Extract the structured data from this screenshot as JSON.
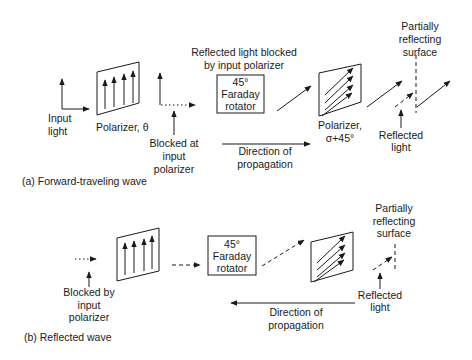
{
  "figure": {
    "panel_a": {
      "caption": "(a)  Forward-traveling wave",
      "input_light": [
        "Input",
        "light"
      ],
      "polarizer_1": {
        "label": "Polarizer, θ",
        "orientation": "vertical"
      },
      "blocked_at_input": [
        "Blocked at",
        "input",
        "polarizer"
      ],
      "reflected_blocked_note": [
        "Reflected light blocked",
        "by input polarizer"
      ],
      "faraday_rotator": [
        "45°",
        "Faraday",
        "rotator"
      ],
      "polarizer_2": {
        "label": [
          "Polarizer,",
          "σ+45°"
        ],
        "orientation": "45-degree"
      },
      "surface": [
        "Partially",
        "reflecting",
        "surface"
      ],
      "reflected_light": [
        "Reflected",
        "light"
      ],
      "propagation": {
        "label": [
          "Direction of",
          "propagation"
        ],
        "direction": "right"
      }
    },
    "panel_b": {
      "caption": "(b) Reflected wave",
      "blocked_by_input": [
        "Blocked by",
        "input",
        "polarizer"
      ],
      "faraday_rotator": [
        "45°",
        "Faraday",
        "rotator"
      ],
      "surface": [
        "Partially",
        "reflecting",
        "surface"
      ],
      "reflected_light": [
        "Reflected",
        "light"
      ],
      "propagation": {
        "label": [
          "Direction of",
          "propagation"
        ],
        "direction": "left"
      }
    },
    "colors": {
      "ink": "#1a1a1a",
      "background": "#ffffff"
    }
  }
}
